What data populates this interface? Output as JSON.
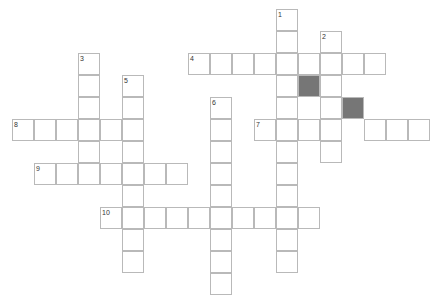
{
  "puzzle": {
    "title": "Crossword Puzzle Grid",
    "cell_size": 22,
    "origin_x": 12,
    "origin_y": 9,
    "colors": {
      "cell_fill": "#ffffff",
      "cell_border": "#b9b9b9",
      "block_fill": "#767676",
      "number_text": "#333333",
      "background": "#ffffff"
    },
    "clue_numbers": [
      "1",
      "2",
      "3",
      "4",
      "5",
      "6",
      "7",
      "8",
      "9",
      "10"
    ],
    "entries": [
      {
        "number": "1",
        "direction": "down",
        "col": 12,
        "row": 0,
        "length": 12
      },
      {
        "number": "2",
        "direction": "down",
        "col": 14,
        "row": 1,
        "length": 7
      },
      {
        "number": "3",
        "direction": "down",
        "col": 3,
        "row": 2,
        "length": 5
      },
      {
        "number": "4",
        "direction": "across",
        "col": 8,
        "row": 2,
        "length": 9
      },
      {
        "number": "5",
        "direction": "down",
        "col": 5,
        "row": 3,
        "length": 9
      },
      {
        "number": "6",
        "direction": "down",
        "col": 9,
        "row": 4,
        "length": 9
      },
      {
        "number": "7",
        "direction": "across",
        "col": 11,
        "row": 5,
        "length": 8
      },
      {
        "number": "8",
        "direction": "across",
        "col": 0,
        "row": 5,
        "length": 6
      },
      {
        "number": "9",
        "direction": "across",
        "col": 1,
        "row": 7,
        "length": 7
      },
      {
        "number": "10",
        "direction": "across",
        "col": 4,
        "row": 9,
        "length": 10
      }
    ],
    "blocks": [
      {
        "col": 13,
        "row": 3
      },
      {
        "col": 15,
        "row": 4
      }
    ],
    "cells": [
      {
        "col": 12,
        "row": 0,
        "number": "1"
      },
      {
        "col": 12,
        "row": 1
      },
      {
        "col": 14,
        "row": 1,
        "number": "2"
      },
      {
        "col": 3,
        "row": 2,
        "number": "3"
      },
      {
        "col": 8,
        "row": 2,
        "number": "4"
      },
      {
        "col": 9,
        "row": 2
      },
      {
        "col": 10,
        "row": 2
      },
      {
        "col": 11,
        "row": 2
      },
      {
        "col": 12,
        "row": 2
      },
      {
        "col": 13,
        "row": 2
      },
      {
        "col": 14,
        "row": 2
      },
      {
        "col": 15,
        "row": 2
      },
      {
        "col": 16,
        "row": 2
      },
      {
        "col": 3,
        "row": 3
      },
      {
        "col": 5,
        "row": 3,
        "number": "5"
      },
      {
        "col": 12,
        "row": 3
      },
      {
        "col": 13,
        "row": 3,
        "block": true
      },
      {
        "col": 14,
        "row": 3
      },
      {
        "col": 3,
        "row": 4
      },
      {
        "col": 5,
        "row": 4
      },
      {
        "col": 9,
        "row": 4,
        "number": "6"
      },
      {
        "col": 12,
        "row": 4
      },
      {
        "col": 14,
        "row": 4
      },
      {
        "col": 15,
        "row": 4,
        "block": true
      },
      {
        "col": 0,
        "row": 5,
        "number": "8"
      },
      {
        "col": 1,
        "row": 5
      },
      {
        "col": 2,
        "row": 5
      },
      {
        "col": 3,
        "row": 5
      },
      {
        "col": 4,
        "row": 5
      },
      {
        "col": 5,
        "row": 5
      },
      {
        "col": 9,
        "row": 5
      },
      {
        "col": 11,
        "row": 5,
        "number": "7"
      },
      {
        "col": 12,
        "row": 5
      },
      {
        "col": 13,
        "row": 5
      },
      {
        "col": 14,
        "row": 5
      },
      {
        "col": 16,
        "row": 5
      },
      {
        "col": 17,
        "row": 5
      },
      {
        "col": 18,
        "row": 5
      },
      {
        "col": 3,
        "row": 6
      },
      {
        "col": 5,
        "row": 6
      },
      {
        "col": 9,
        "row": 6
      },
      {
        "col": 12,
        "row": 6
      },
      {
        "col": 14,
        "row": 6
      },
      {
        "col": 1,
        "row": 7,
        "number": "9"
      },
      {
        "col": 2,
        "row": 7
      },
      {
        "col": 3,
        "row": 7
      },
      {
        "col": 4,
        "row": 7
      },
      {
        "col": 5,
        "row": 7
      },
      {
        "col": 6,
        "row": 7
      },
      {
        "col": 7,
        "row": 7
      },
      {
        "col": 9,
        "row": 7
      },
      {
        "col": 12,
        "row": 7
      },
      {
        "col": 5,
        "row": 8
      },
      {
        "col": 9,
        "row": 8
      },
      {
        "col": 12,
        "row": 8
      },
      {
        "col": 4,
        "row": 9,
        "number": "10"
      },
      {
        "col": 5,
        "row": 9
      },
      {
        "col": 6,
        "row": 9
      },
      {
        "col": 7,
        "row": 9
      },
      {
        "col": 8,
        "row": 9
      },
      {
        "col": 9,
        "row": 9
      },
      {
        "col": 10,
        "row": 9
      },
      {
        "col": 11,
        "row": 9
      },
      {
        "col": 12,
        "row": 9
      },
      {
        "col": 13,
        "row": 9
      },
      {
        "col": 5,
        "row": 10
      },
      {
        "col": 9,
        "row": 10
      },
      {
        "col": 12,
        "row": 10
      },
      {
        "col": 5,
        "row": 11
      },
      {
        "col": 9,
        "row": 11
      },
      {
        "col": 12,
        "row": 11
      },
      {
        "col": 9,
        "row": 12
      }
    ]
  }
}
